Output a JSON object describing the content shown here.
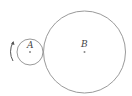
{
  "diagram": {
    "circles": [
      {
        "id": "A",
        "label": "A",
        "cx": 30,
        "cy": 52,
        "r": 13
      },
      {
        "id": "B",
        "label": "B",
        "cx": 84.5,
        "cy": 52,
        "r": 41
      }
    ],
    "rotation_arrow": {
      "direction": "counterclockwise",
      "side": "left of A"
    },
    "colors": {
      "stroke": "#9a9a9a",
      "label": "#444444",
      "center_dot": "#888888"
    }
  }
}
